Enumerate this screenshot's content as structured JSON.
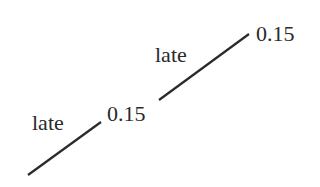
{
  "diagram": {
    "type": "probability-tree-fragment",
    "branches": [
      {
        "outcome": "late",
        "probability": "0.15",
        "from": [
          28,
          175
        ],
        "to": [
          101,
          122
        ]
      },
      {
        "outcome": "late",
        "probability": "0.15",
        "from": [
          159,
          100
        ],
        "to": [
          249,
          34
        ]
      }
    ],
    "line_color": "#2a2a2a",
    "text_color": "#2a2a2a"
  }
}
